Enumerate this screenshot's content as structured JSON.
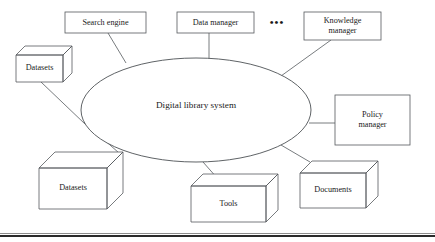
{
  "figure": {
    "center_node": {
      "label": "Digital library system",
      "shape": "ellipse",
      "cx": 196,
      "cy": 110,
      "rx": 115,
      "ry": 52
    },
    "ellipsis": {
      "label": "•••",
      "name": "more-components-ellipsis",
      "x": 277,
      "y": 23
    },
    "rect_nodes": [
      {
        "id": "search-engine",
        "label": "Search engine",
        "lines": [
          "Search engine"
        ],
        "x": 65,
        "y": 12,
        "w": 81,
        "h": 21
      },
      {
        "id": "data-manager",
        "label": "Data manager",
        "lines": [
          "Data manager"
        ],
        "x": 177,
        "y": 12,
        "w": 77,
        "h": 21
      },
      {
        "id": "knowledge-manager",
        "label": "Knowledge manager",
        "lines": [
          "Knowledge",
          "manager"
        ],
        "x": 304,
        "y": 12,
        "w": 77,
        "h": 28
      },
      {
        "id": "policy-manager",
        "label": "Policy manager",
        "lines": [
          "Policy",
          "manager"
        ],
        "x": 335,
        "y": 95,
        "w": 75,
        "h": 50
      }
    ],
    "cube_nodes": [
      {
        "id": "datasets-top",
        "label": "Datasets",
        "x": 16,
        "y": 55,
        "w": 47,
        "h": 27,
        "d": 9
      },
      {
        "id": "datasets-bottom",
        "label": "Datasets",
        "x": 39,
        "y": 168,
        "w": 68,
        "h": 41,
        "d": 16
      },
      {
        "id": "tools",
        "label": "Tools",
        "x": 191,
        "y": 186,
        "w": 75,
        "h": 36,
        "d": 12
      },
      {
        "id": "documents",
        "label": "Documents",
        "x": 300,
        "y": 173,
        "w": 66,
        "h": 35,
        "d": 12
      }
    ],
    "connectors": [
      {
        "id": "search-engine-to-core",
        "from": "search-engine",
        "to": "center-node",
        "x1": 108,
        "y1": 33,
        "x2": 126,
        "y2": 63
      },
      {
        "id": "data-manager-to-core",
        "from": "data-manager",
        "to": "center-node",
        "x1": 209,
        "y1": 33,
        "x2": 209,
        "y2": 59
      },
      {
        "id": "knowledge-manager-to-core",
        "from": "knowledge-manager",
        "to": "center-node",
        "x1": 331,
        "y1": 40,
        "x2": 281,
        "y2": 76
      },
      {
        "id": "policy-manager-to-core",
        "from": "policy-manager",
        "to": "center-node",
        "x1": 335,
        "y1": 123,
        "x2": 309,
        "y2": 123
      },
      {
        "id": "datasets-top-to-core",
        "from": "datasets-top",
        "to": "center-node",
        "x1": 41,
        "y1": 82,
        "x2": 85,
        "y2": 124
      },
      {
        "id": "datasets-bottom-to-core",
        "from": "datasets-bottom",
        "to": "center-node",
        "x1": 119,
        "y1": 153,
        "x2": 101,
        "y2": 137
      },
      {
        "id": "tools-to-core",
        "from": "tools",
        "to": "center-node",
        "x1": 218,
        "y1": 179,
        "x2": 203,
        "y2": 162
      },
      {
        "id": "documents-to-core",
        "from": "documents",
        "to": "center-node",
        "x1": 310,
        "y1": 162,
        "x2": 281,
        "y2": 145
      }
    ]
  },
  "colors": {
    "background": "#ffffff",
    "stroke": "#55595d",
    "text": "#1a1a1a",
    "rule": "#2b2b2b"
  }
}
